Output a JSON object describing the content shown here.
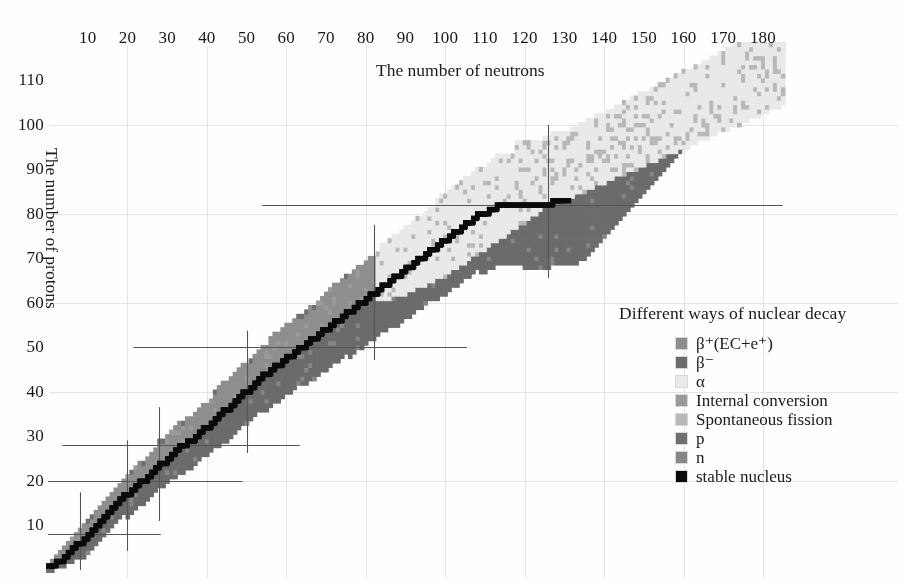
{
  "figure": {
    "kind": "nuclide-chart",
    "background": "#fefefe"
  },
  "axes": {
    "x": {
      "title": "The number of neutrons",
      "ticks": [
        10,
        20,
        30,
        40,
        50,
        60,
        70,
        80,
        90,
        100,
        110,
        120,
        130,
        140,
        150,
        160,
        170,
        180
      ],
      "min": 0,
      "max": 185,
      "position": "top"
    },
    "y": {
      "title": "The number of protons",
      "ticks": [
        10,
        20,
        30,
        40,
        50,
        60,
        70,
        80,
        90,
        100,
        110
      ],
      "min": 0,
      "max": 118,
      "position": "left"
    }
  },
  "legend": {
    "title": "Different ways of nuclear decay",
    "items": [
      {
        "label": "β⁺(EC+e⁺)",
        "key": "beta_plus",
        "color": "#8e8e8e"
      },
      {
        "label": "β⁻",
        "key": "beta_minus",
        "color": "#6b6b6b"
      },
      {
        "label": "α",
        "key": "alpha",
        "color": "#e9e9e9"
      },
      {
        "label": "Internal conversion",
        "key": "ic",
        "color": "#9a9a9a"
      },
      {
        "label": "Spontaneous fission",
        "key": "sf",
        "color": "#b8b8b8"
      },
      {
        "label": "p",
        "key": "proton",
        "color": "#6f6f6f"
      },
      {
        "label": "n",
        "key": "neutron",
        "color": "#868686"
      },
      {
        "label": "stable nucleus",
        "key": "stable",
        "color": "#0a0a0a"
      }
    ]
  },
  "magic_numbers": {
    "neutron_lines": [
      8,
      20,
      28,
      50,
      82,
      126
    ],
    "proton_lines": [
      8,
      20,
      28,
      50,
      82
    ],
    "line_color": "#555555"
  },
  "gridlines": {
    "color": "#e4e4e4",
    "x_step": 20,
    "y_step": 20,
    "visible": true
  },
  "chart_data": {
    "type": "heatmap",
    "title": "",
    "xlabel": "The number of neutrons",
    "ylabel": "The number of protons",
    "xlim": [
      0,
      185
    ],
    "ylim": [
      0,
      118
    ],
    "grid": true,
    "legend_position": "right",
    "categories": [
      "beta_plus",
      "beta_minus",
      "alpha",
      "ic",
      "sf",
      "proton",
      "neutron",
      "stable"
    ],
    "category_colors": {
      "beta_plus": "#8e8e8e",
      "beta_minus": "#6b6b6b",
      "alpha": "#e9e9e9",
      "ic": "#9a9a9a",
      "sf": "#b8b8b8",
      "proton": "#6f6f6f",
      "neutron": "#868686",
      "stable": "#0a0a0a"
    },
    "valley_of_stability": {
      "comment": "Z as a function of N along the line of beta stability; stable nuclei drawn in black.",
      "points": [
        [
          0,
          1
        ],
        [
          1,
          1
        ],
        [
          2,
          2
        ],
        [
          3,
          2
        ],
        [
          4,
          3
        ],
        [
          5,
          4
        ],
        [
          6,
          5
        ],
        [
          7,
          6
        ],
        [
          8,
          6
        ],
        [
          9,
          7
        ],
        [
          10,
          8
        ],
        [
          11,
          9
        ],
        [
          12,
          10
        ],
        [
          13,
          11
        ],
        [
          14,
          12
        ],
        [
          15,
          13
        ],
        [
          16,
          14
        ],
        [
          17,
          15
        ],
        [
          18,
          16
        ],
        [
          19,
          17
        ],
        [
          20,
          17
        ],
        [
          21,
          18
        ],
        [
          22,
          19
        ],
        [
          23,
          20
        ],
        [
          24,
          20
        ],
        [
          25,
          21
        ],
        [
          26,
          22
        ],
        [
          27,
          23
        ],
        [
          28,
          24
        ],
        [
          29,
          24
        ],
        [
          30,
          25
        ],
        [
          31,
          26
        ],
        [
          32,
          27
        ],
        [
          33,
          28
        ],
        [
          34,
          28
        ],
        [
          35,
          29
        ],
        [
          36,
          29
        ],
        [
          37,
          30
        ],
        [
          38,
          31
        ],
        [
          39,
          32
        ],
        [
          40,
          32
        ],
        [
          41,
          33
        ],
        [
          42,
          34
        ],
        [
          43,
          35
        ],
        [
          44,
          36
        ],
        [
          45,
          36
        ],
        [
          46,
          37
        ],
        [
          47,
          38
        ],
        [
          48,
          39
        ],
        [
          49,
          40
        ],
        [
          50,
          40
        ],
        [
          51,
          41
        ],
        [
          52,
          42
        ],
        [
          53,
          43
        ],
        [
          54,
          44
        ],
        [
          55,
          44
        ],
        [
          56,
          45
        ],
        [
          57,
          46
        ],
        [
          58,
          46
        ],
        [
          59,
          47
        ],
        [
          60,
          48
        ],
        [
          61,
          48
        ],
        [
          62,
          49
        ],
        [
          63,
          50
        ],
        [
          64,
          50
        ],
        [
          65,
          51
        ],
        [
          66,
          52
        ],
        [
          67,
          52
        ],
        [
          68,
          53
        ],
        [
          69,
          54
        ],
        [
          70,
          54
        ],
        [
          71,
          55
        ],
        [
          72,
          56
        ],
        [
          73,
          56
        ],
        [
          74,
          57
        ],
        [
          75,
          58
        ],
        [
          76,
          58
        ],
        [
          77,
          59
        ],
        [
          78,
          60
        ],
        [
          79,
          60
        ],
        [
          80,
          61
        ],
        [
          81,
          62
        ],
        [
          82,
          62
        ],
        [
          83,
          63
        ],
        [
          84,
          64
        ],
        [
          85,
          64
        ],
        [
          86,
          65
        ],
        [
          87,
          66
        ],
        [
          88,
          66
        ],
        [
          89,
          67
        ],
        [
          90,
          68
        ],
        [
          91,
          68
        ],
        [
          92,
          69
        ],
        [
          93,
          70
        ],
        [
          94,
          70
        ],
        [
          95,
          71
        ],
        [
          96,
          72
        ],
        [
          97,
          72
        ],
        [
          98,
          73
        ],
        [
          99,
          74
        ],
        [
          100,
          74
        ],
        [
          101,
          75
        ],
        [
          102,
          76
        ],
        [
          103,
          76
        ],
        [
          104,
          77
        ],
        [
          105,
          78
        ],
        [
          106,
          78
        ],
        [
          107,
          79
        ],
        [
          108,
          80
        ],
        [
          109,
          80
        ],
        [
          110,
          80
        ],
        [
          111,
          81
        ],
        [
          112,
          81
        ],
        [
          113,
          82
        ],
        [
          114,
          82
        ],
        [
          115,
          82
        ],
        [
          116,
          82
        ],
        [
          117,
          82
        ],
        [
          118,
          82
        ],
        [
          119,
          82
        ],
        [
          120,
          82
        ],
        [
          121,
          82
        ],
        [
          122,
          82
        ],
        [
          123,
          82
        ],
        [
          124,
          82
        ],
        [
          125,
          82
        ],
        [
          126,
          82
        ],
        [
          127,
          83
        ],
        [
          128,
          83
        ],
        [
          129,
          83
        ],
        [
          130,
          83
        ]
      ]
    },
    "band_limits": {
      "comment": "For each N: lowest Z (neutron drip side) and highest Z (proton drip side) of the known-nuclide band.",
      "n_start": 0,
      "z_low": [
        0,
        0,
        1,
        1,
        1,
        2,
        2,
        2,
        3,
        3,
        3,
        4,
        4,
        5,
        5,
        5,
        6,
        6,
        7,
        7,
        7,
        8,
        8,
        9,
        9,
        10,
        10,
        11,
        11,
        12,
        12,
        13,
        13,
        14,
        14,
        15,
        15,
        16,
        16,
        17,
        17,
        18,
        18,
        19,
        19,
        20,
        20,
        21,
        21,
        22,
        22,
        23,
        23,
        24,
        24,
        25,
        25,
        26,
        26,
        27,
        27,
        28,
        28,
        29,
        29,
        30,
        30,
        31,
        31,
        32,
        32,
        33,
        33,
        34,
        34,
        35,
        35,
        36,
        36,
        37,
        37,
        38,
        38,
        39,
        39,
        40,
        40,
        41,
        41,
        42,
        42,
        43,
        43,
        44,
        44,
        45,
        45,
        46,
        46,
        47,
        47,
        48,
        48,
        49,
        49,
        50,
        50,
        51,
        51,
        52,
        52,
        53,
        53,
        54,
        54,
        55,
        55,
        56,
        56,
        57,
        57,
        58,
        58,
        59,
        59,
        60,
        61,
        62,
        63,
        64,
        65,
        66,
        67,
        68,
        69,
        70,
        71,
        72,
        73,
        74,
        75,
        76,
        77,
        78,
        79,
        80,
        81,
        82,
        83,
        84,
        85,
        86,
        87,
        88,
        89,
        90,
        91,
        92,
        93,
        94,
        95,
        96,
        97,
        98,
        99,
        100,
        101,
        102,
        103,
        104,
        105,
        106,
        107,
        108,
        109,
        110,
        111,
        112,
        113,
        114,
        115
      ],
      "z_high": [
        1,
        2,
        3,
        4,
        5,
        6,
        7,
        8,
        9,
        10,
        11,
        12,
        13,
        14,
        15,
        16,
        17,
        18,
        19,
        20,
        21,
        22,
        23,
        24,
        25,
        26,
        27,
        28,
        29,
        30,
        31,
        32,
        33,
        34,
        35,
        36,
        37,
        38,
        39,
        40,
        41,
        42,
        43,
        44,
        45,
        46,
        47,
        48,
        49,
        50,
        51,
        52,
        53,
        54,
        55,
        56,
        57,
        58,
        59,
        60,
        61,
        62,
        63,
        64,
        65,
        66,
        67,
        68,
        69,
        70,
        71,
        72,
        73,
        74,
        75,
        76,
        77,
        78,
        79,
        80,
        81,
        82,
        83,
        84,
        85,
        86,
        87,
        88,
        89,
        90,
        91,
        92,
        93,
        94,
        95,
        96,
        97,
        98,
        99,
        100,
        101,
        102,
        103,
        104,
        105,
        106,
        107,
        108,
        109,
        110,
        111,
        112,
        113,
        114,
        115,
        116,
        117,
        117,
        118,
        118,
        118,
        118,
        118,
        118,
        118,
        118,
        118,
        118,
        118,
        118,
        118,
        118,
        118,
        118,
        118,
        118,
        118,
        118,
        118,
        118,
        118,
        118,
        118,
        118,
        118,
        118,
        118,
        118,
        118,
        118,
        118,
        118,
        118,
        118,
        118,
        118,
        118,
        118,
        118,
        118,
        118,
        118,
        118,
        118,
        118,
        118,
        118,
        118,
        118,
        118,
        118,
        118,
        118,
        118,
        118,
        118,
        118,
        118,
        118,
        118,
        118,
        118,
        118,
        118,
        118,
        118
      ]
    },
    "regions": {
      "alpha_threshold_z": 83,
      "alpha_lower_edge": {
        "comment": "Above this polyline (Z greater than value at given N) alpha decay dominates.",
        "points": [
          [
            82,
            60
          ],
          [
            90,
            62
          ],
          [
            100,
            66
          ],
          [
            110,
            72
          ],
          [
            120,
            78
          ],
          [
            126,
            82
          ],
          [
            140,
            88
          ],
          [
            150,
            92
          ],
          [
            165,
            98
          ],
          [
            185,
            104
          ]
        ]
      },
      "sf_region": {
        "comment": "Spontaneous fission patches appear in the heaviest corner.",
        "min_z": 96,
        "min_n": 140
      }
    }
  }
}
